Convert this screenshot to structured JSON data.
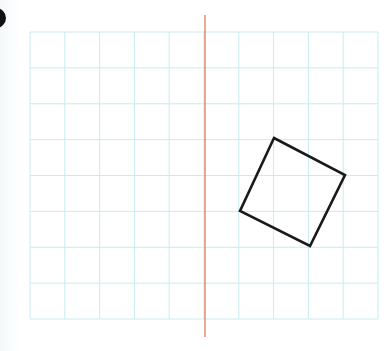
{
  "figure": {
    "type": "grid-reflection-exercise",
    "colors": {
      "grid_line": "#c8ecf0",
      "mirror_line": "#e07a5f",
      "shape_stroke": "#1a1a1a",
      "bullet": "#111111"
    },
    "grid": {
      "left": 30,
      "top": 32,
      "right": 378,
      "bottom": 319,
      "columns": 10,
      "rows": 8
    },
    "mirror_line": {
      "x": 205,
      "y1": 15,
      "y2": 337
    },
    "shape": {
      "name": "square",
      "vertices": [
        [
          274,
          138
        ],
        [
          345,
          175
        ],
        [
          310,
          246
        ],
        [
          240,
          211
        ]
      ]
    }
  }
}
